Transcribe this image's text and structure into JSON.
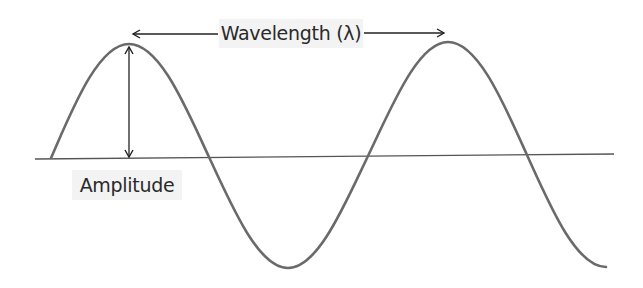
{
  "diagram": {
    "labels": {
      "wavelength": "Wavelength (λ)",
      "amplitude": "Amplitude"
    },
    "colors": {
      "wave": "#6a6a6a",
      "baseline": "#555555",
      "arrows": "#222222",
      "label_background": "#f3f3f3",
      "label_text": "#2a2a2a"
    },
    "geometry": {
      "baseline": {
        "x1": 35,
        "y1": 159,
        "x2": 614,
        "y2": 154
      },
      "wave_points": {
        "start": [
          51,
          158
        ],
        "peak_1": [
          129,
          44
        ],
        "zero_1": [
          209,
          157
        ],
        "trough_1": [
          288,
          268
        ],
        "zero_2": [
          368,
          156
        ],
        "peak_2": [
          448,
          42
        ],
        "zero_3": [
          527,
          155
        ],
        "end": [
          606,
          267
        ]
      },
      "wavelength_arrow": {
        "x1": 131,
        "y1": 34,
        "x2": 446,
        "y2": 33
      },
      "amplitude_arrow": {
        "x": 129,
        "y_top": 46,
        "y_bottom": 157
      }
    }
  }
}
